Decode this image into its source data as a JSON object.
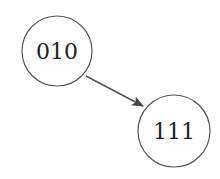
{
  "diagram": {
    "nodes": [
      {
        "id": "n1",
        "label": "010",
        "cx": 57,
        "cy": 51,
        "r": 35
      },
      {
        "id": "n2",
        "label": "111",
        "cx": 174,
        "cy": 131,
        "r": 36
      }
    ],
    "edges": [
      {
        "from": "010",
        "to": "111",
        "directed": true
      }
    ],
    "colors": {
      "stroke": "#555555",
      "arrow": "#444444",
      "text": "#222222"
    }
  }
}
